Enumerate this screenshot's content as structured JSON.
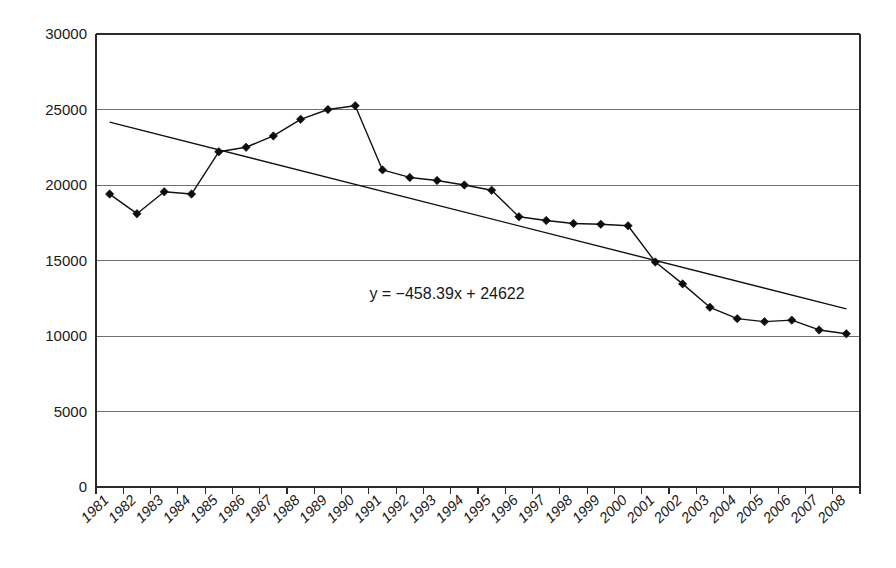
{
  "chart_data": {
    "type": "line",
    "title": "",
    "subtitle": "",
    "xlabel": "",
    "ylabel": "",
    "grid": true,
    "legend": null,
    "ylim": [
      0,
      30000
    ],
    "ytick_labels": [
      "30000",
      "25000",
      "20000",
      "15000",
      "10000",
      "5000",
      "0"
    ],
    "yticks": [
      30000,
      25000,
      20000,
      15000,
      10000,
      5000,
      0
    ],
    "categories": [
      "1981",
      "1982",
      "1983",
      "1984",
      "1985",
      "1986",
      "1987",
      "1988",
      "1989",
      "1990",
      "1991",
      "1992",
      "1993",
      "1994",
      "1995",
      "1996",
      "1997",
      "1998",
      "1999",
      "2000",
      "2001",
      "2002",
      "2003",
      "2004",
      "2005",
      "2006",
      "2007",
      "2008"
    ],
    "values": [
      19400,
      18100,
      19550,
      19400,
      22200,
      22500,
      23250,
      24350,
      25000,
      25250,
      21000,
      20500,
      20300,
      20000,
      19650,
      17900,
      17650,
      17450,
      17400,
      17300,
      14900,
      13450,
      11900,
      11150,
      10950,
      11050,
      10400,
      10150
    ],
    "series": [
      {
        "name": "data",
        "marker": "diamond",
        "values": [
          19400,
          18100,
          19550,
          19400,
          22200,
          22500,
          23250,
          24350,
          25000,
          25250,
          21000,
          20500,
          20300,
          20000,
          19650,
          17900,
          17650,
          17450,
          17400,
          17300,
          14900,
          13450,
          11900,
          11150,
          10950,
          11050,
          10400,
          10150
        ]
      }
    ],
    "trendline": {
      "equation": "y = −458.39x + 24622",
      "slope": -458.39,
      "intercept": 24622,
      "start_value": 24164,
      "end_value": 11795
    },
    "annotations": [
      {
        "name": "trendline-equation",
        "text": "y = −458.39x + 24622"
      }
    ],
    "colors": {
      "line": "#111111",
      "marker": "#0d0d0d",
      "grid": "#6e6e6e",
      "axis": "#2b2b2b",
      "background": "#ffffff"
    }
  }
}
